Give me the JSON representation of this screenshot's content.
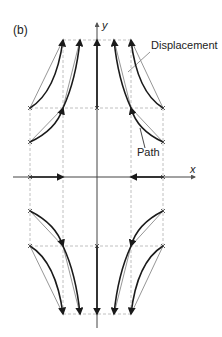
{
  "figure": {
    "panel_label": "(b)",
    "axes": {
      "x_label": "x",
      "y_label": "y"
    },
    "annotations": {
      "displacement": "Displacement",
      "path": "Path"
    },
    "colors": {
      "path_stroke": "#1a1a1a",
      "displacement_stroke": "#8a8a8a",
      "grid_dash": "#b0b0b0",
      "axis": "#444444",
      "text": "#222222"
    },
    "grid": {
      "vertical_x": [
        30,
        63,
        131,
        163
      ],
      "horizontal_y": [
        40,
        108,
        246,
        314
      ]
    },
    "origin": {
      "x": 97,
      "y": 177
    }
  }
}
